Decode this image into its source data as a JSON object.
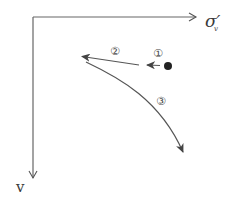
{
  "diagram": {
    "axes": {
      "x_label": "σ′",
      "x_label_sub": "v",
      "y_label": "v"
    },
    "paths": [
      {
        "id": "1",
        "label": "①",
        "description": "short arrow from initial state point leftward"
      },
      {
        "id": "2",
        "label": "②",
        "description": "arrow continuing left and slightly up"
      },
      {
        "id": "3",
        "label": "③",
        "description": "curve descending to the right"
      }
    ],
    "colors": {
      "line": "#555555",
      "dot": "#222222",
      "text": "#3a3a3a"
    }
  }
}
